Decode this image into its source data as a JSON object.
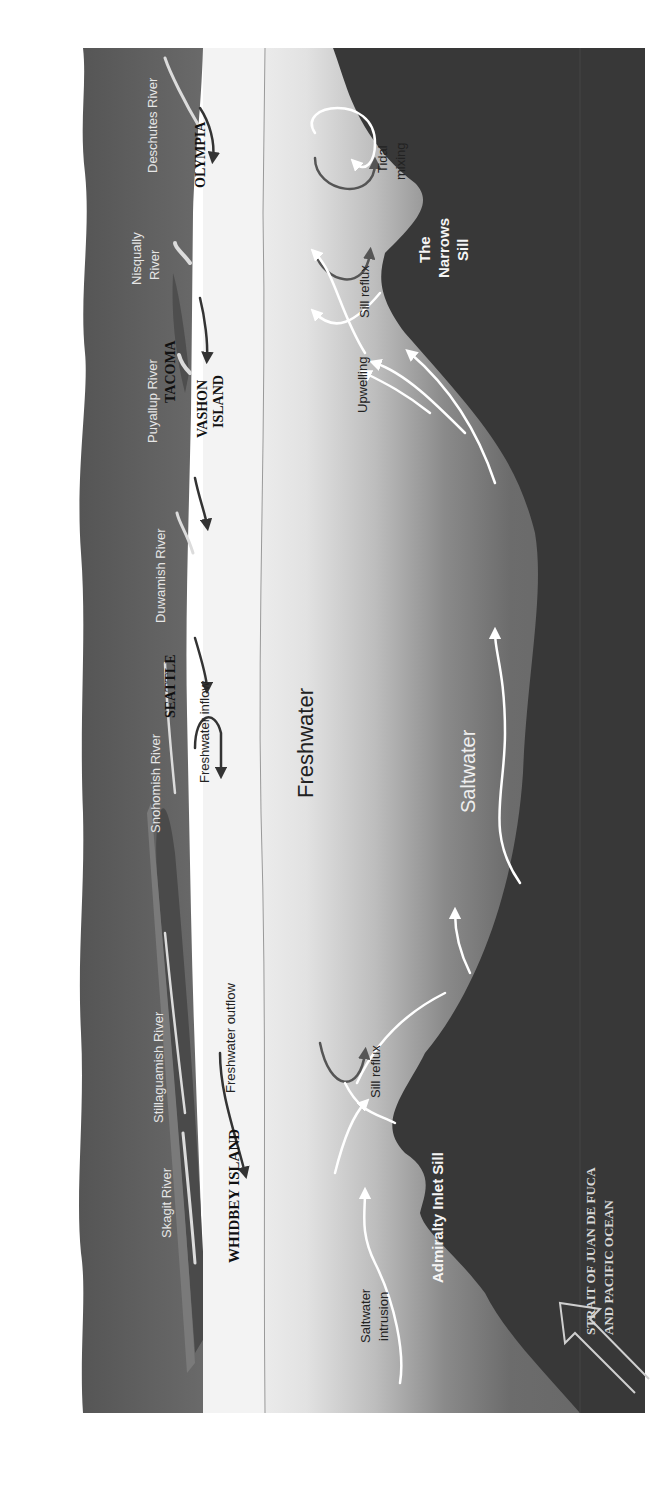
{
  "diagram": {
    "orientation": "rotated-90-ccw",
    "colors": {
      "land": "#5e5e5e",
      "land_dark": "#555555",
      "island": "#6e6e6e",
      "surface_water": "#f2f2f2",
      "freshwater_light": "#e8e8e8",
      "saltwater": "#6a6a6a",
      "seabed": "#3a3a3a",
      "river": "#e0e0e0",
      "arrow_dark": "#333333",
      "arrow_light": "#ffffff",
      "sill_arrow_dark": "#555555"
    },
    "places": {
      "olympia": "OLYMPIA",
      "tacoma": "TACOMA",
      "vashon_1": "VASHON",
      "vashon_2": "ISLAND",
      "seattle": "SEATTLE",
      "whidbey": "WHIDBEY ISLAND"
    },
    "rivers": {
      "deschutes": "Deschutes River",
      "nisqually_1": "Nisqually",
      "nisqually_2": "River",
      "puyallup": "Puyallup River",
      "duwamish": "Duwamish River",
      "snohomish": "Snohomish River",
      "stillaguamish": "Stillaguamish River",
      "skagit": "Skagit River"
    },
    "flows": {
      "freshwater_inflow": "Freshwater inflow",
      "freshwater_outflow": "Freshwater outflow",
      "tidal_mixing_1": "Tidal",
      "tidal_mixing_2": "mixing",
      "sill_reflux_south": "Sill reflux",
      "sill_reflux_north": "Sill reflux",
      "upwelling": "Upwelling",
      "saltwater_intrusion_1": "Saltwater",
      "saltwater_intrusion_2": "intrusion"
    },
    "layers": {
      "freshwater": "Freshwater",
      "saltwater": "Saltwater"
    },
    "sills": {
      "narrows_1": "The",
      "narrows_2": "Narrows",
      "narrows_3": "Sill",
      "admiralty": "Admiralty Inlet Sill"
    },
    "ocean": {
      "line_1": "STRAIT OF JUAN DE FUCA",
      "line_2": "AND PACIFIC OCEAN"
    }
  }
}
